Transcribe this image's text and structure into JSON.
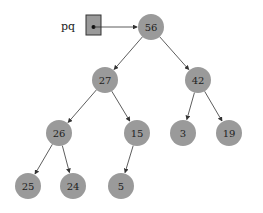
{
  "pointer": {
    "label": "pq",
    "target": "56"
  },
  "colors": {
    "node_fill": "#9a9a9a",
    "box_fill": "#9a9a9a",
    "edge": "#333333",
    "text": "#222222"
  },
  "nodes": [
    {
      "id": "56",
      "label": "56",
      "x": 151,
      "y": 27
    },
    {
      "id": "27",
      "label": "27",
      "x": 105,
      "y": 80
    },
    {
      "id": "42",
      "label": "42",
      "x": 198,
      "y": 80
    },
    {
      "id": "26",
      "label": "26",
      "x": 59,
      "y": 133
    },
    {
      "id": "15",
      "label": "15",
      "x": 137,
      "y": 133
    },
    {
      "id": "3",
      "label": "3",
      "x": 183,
      "y": 133
    },
    {
      "id": "19",
      "label": "19",
      "x": 229,
      "y": 133
    },
    {
      "id": "25",
      "label": "25",
      "x": 28,
      "y": 186
    },
    {
      "id": "24",
      "label": "24",
      "x": 73,
      "y": 186
    },
    {
      "id": "5",
      "label": "5",
      "x": 121,
      "y": 186
    }
  ],
  "edges": [
    [
      "56",
      "27"
    ],
    [
      "56",
      "42"
    ],
    [
      "27",
      "26"
    ],
    [
      "27",
      "15"
    ],
    [
      "42",
      "3"
    ],
    [
      "42",
      "19"
    ],
    [
      "26",
      "25"
    ],
    [
      "26",
      "24"
    ],
    [
      "15",
      "5"
    ]
  ]
}
